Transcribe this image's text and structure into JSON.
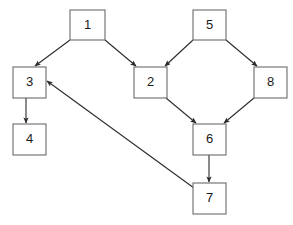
{
  "diagram": {
    "watermark": "",
    "canvas": {
      "width": 293,
      "height": 225
    },
    "style": {
      "node_fill": "#ffffff",
      "node_stroke": "#6b6b6b",
      "edge_color": "#2b2b2b",
      "label_color": "#1a1a1a",
      "background": "#ffffff"
    },
    "nodes": [
      {
        "id": "1",
        "label": "1",
        "x": 70,
        "y": 10,
        "w": 35,
        "h": 30
      },
      {
        "id": "2",
        "label": "2",
        "x": 134,
        "y": 67,
        "w": 33,
        "h": 31
      },
      {
        "id": "3",
        "label": "3",
        "x": 13,
        "y": 67,
        "w": 33,
        "h": 31
      },
      {
        "id": "4",
        "label": "4",
        "x": 13,
        "y": 124,
        "w": 33,
        "h": 31
      },
      {
        "id": "5",
        "label": "5",
        "x": 193,
        "y": 10,
        "w": 33,
        "h": 30
      },
      {
        "id": "6",
        "label": "6",
        "x": 193,
        "y": 124,
        "w": 33,
        "h": 31
      },
      {
        "id": "7",
        "label": "7",
        "x": 193,
        "y": 183,
        "w": 33,
        "h": 31
      },
      {
        "id": "8",
        "label": "8",
        "x": 254,
        "y": 67,
        "w": 33,
        "h": 31
      }
    ],
    "edges": [
      {
        "from": "1",
        "to": "3",
        "x1": 70,
        "y1": 40,
        "x2": 35,
        "y2": 66
      },
      {
        "from": "1",
        "to": "2",
        "x1": 105,
        "y1": 40,
        "x2": 136,
        "y2": 66
      },
      {
        "from": "5",
        "to": "2",
        "x1": 193,
        "y1": 40,
        "x2": 165,
        "y2": 66
      },
      {
        "from": "5",
        "to": "8",
        "x1": 226,
        "y1": 40,
        "x2": 257,
        "y2": 66
      },
      {
        "from": "3",
        "to": "4",
        "x1": 26,
        "y1": 98,
        "x2": 26,
        "y2": 123
      },
      {
        "from": "2",
        "to": "6",
        "x1": 166,
        "y1": 98,
        "x2": 196,
        "y2": 123
      },
      {
        "from": "8",
        "to": "6",
        "x1": 254,
        "y1": 98,
        "x2": 224,
        "y2": 123
      },
      {
        "from": "6",
        "to": "7",
        "x1": 209,
        "y1": 155,
        "x2": 209,
        "y2": 182
      },
      {
        "from": "7",
        "to": "3",
        "x1": 194,
        "y1": 188,
        "x2": 47,
        "y2": 81
      }
    ]
  }
}
